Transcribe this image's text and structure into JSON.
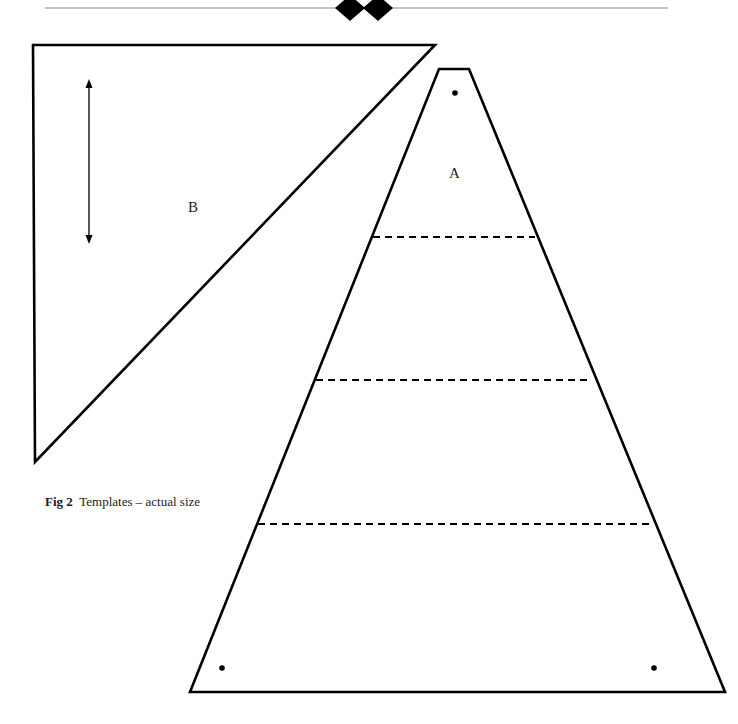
{
  "figure": {
    "number_label": "Fig 2",
    "caption": "Templates – actual size",
    "templates": [
      {
        "id": "A",
        "label": "A",
        "shape": "truncated-triangle",
        "fold_lines": 3,
        "holes": 3
      },
      {
        "id": "B",
        "label": "B",
        "shape": "right-triangle",
        "grain_arrow": "vertical double-headed"
      }
    ]
  },
  "decoration": {
    "header_rule": "horizontal rule with two black diamonds"
  }
}
